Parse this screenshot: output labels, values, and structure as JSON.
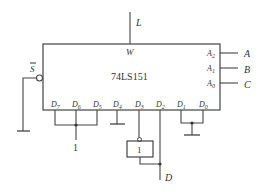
{
  "diagram": {
    "chip_name": "74LS151",
    "output_pin": "W",
    "output_signal": "L",
    "enable_pin": "S",
    "select_pins": [
      {
        "pin": "A",
        "sub": "2",
        "signal": "A"
      },
      {
        "pin": "A",
        "sub": "1",
        "signal": "B"
      },
      {
        "pin": "A",
        "sub": "0",
        "signal": "C"
      }
    ],
    "data_pins": [
      {
        "pin": "D",
        "sub": "7"
      },
      {
        "pin": "D",
        "sub": "6"
      },
      {
        "pin": "D",
        "sub": "5"
      },
      {
        "pin": "D",
        "sub": "4"
      },
      {
        "pin": "D",
        "sub": "3"
      },
      {
        "pin": "D",
        "sub": "2"
      },
      {
        "pin": "D",
        "sub": "1"
      },
      {
        "pin": "D",
        "sub": "0"
      }
    ],
    "logic_high_label": "1",
    "inverter_label": "1",
    "input_signal": "D",
    "colors": {
      "line": "#444444",
      "text": "#333333",
      "background": "#ffffff"
    }
  }
}
